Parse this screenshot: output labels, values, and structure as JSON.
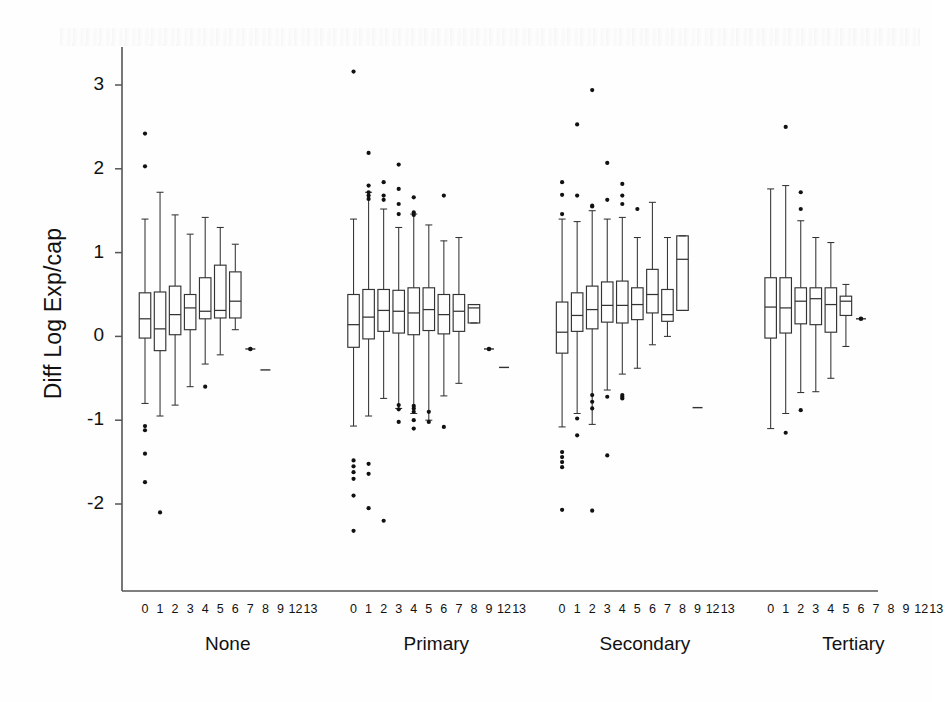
{
  "figure": {
    "background": "#fefefe",
    "ink": "#1a1a1a",
    "axis_color": "#555555",
    "box_color": "#333333",
    "outlier_color": "#111111"
  },
  "axes": {
    "y_label": "Diff Log Exp/cap",
    "y_ticks": [
      "3",
      "2",
      "1",
      "0",
      "-1",
      "-2"
    ],
    "y_tick_values": [
      3,
      2,
      1,
      0,
      -1,
      -2
    ],
    "x_label": "",
    "group_labels": [
      "None",
      "Primary",
      "Secondary",
      "Tertiary"
    ],
    "category_labels": [
      "0",
      "1",
      "2",
      "3",
      "4",
      "5",
      "6",
      "7",
      "8",
      "9",
      "12",
      "13"
    ],
    "frame": {
      "left": 122,
      "right": 878,
      "top": 47,
      "bottom": 591
    },
    "ylim": [
      -2.45,
      3.35
    ],
    "grid": false,
    "legend": "none"
  },
  "chart_data": {
    "type": "box",
    "title": "",
    "xlabel": "",
    "ylabel": "Diff Log Exp/cap",
    "ylim": [
      -2.45,
      3.35
    ],
    "grid": false,
    "legend_position": "none",
    "categories": [
      "0",
      "1",
      "2",
      "3",
      "4",
      "5",
      "6",
      "7",
      "8",
      "9",
      "12",
      "13"
    ],
    "groups": [
      {
        "name": "None",
        "boxes": [
          {
            "cat": "0",
            "whisker_low": -0.8,
            "q1": -0.02,
            "median": 0.21,
            "q3": 0.52,
            "whisker_high": 1.4,
            "outliers": [
              2.42,
              2.03,
              -1.07,
              -1.12,
              -1.4,
              -1.74
            ]
          },
          {
            "cat": "1",
            "whisker_low": -0.95,
            "q1": -0.17,
            "median": 0.09,
            "q3": 0.53,
            "whisker_high": 1.72,
            "outliers": [
              -2.1
            ]
          },
          {
            "cat": "2",
            "whisker_low": -0.82,
            "q1": 0.02,
            "median": 0.26,
            "q3": 0.6,
            "whisker_high": 1.45,
            "outliers": []
          },
          {
            "cat": "3",
            "whisker_low": -0.6,
            "q1": 0.08,
            "median": 0.34,
            "q3": 0.5,
            "whisker_high": 1.22,
            "outliers": []
          },
          {
            "cat": "4",
            "whisker_low": -0.33,
            "q1": 0.21,
            "median": 0.3,
            "q3": 0.7,
            "whisker_high": 1.42,
            "outliers": [
              -0.6
            ]
          },
          {
            "cat": "5",
            "whisker_low": -0.22,
            "q1": 0.22,
            "median": 0.31,
            "q3": 0.85,
            "whisker_high": 1.3,
            "outliers": []
          },
          {
            "cat": "6",
            "whisker_low": 0.08,
            "q1": 0.22,
            "median": 0.42,
            "q3": 0.77,
            "whisker_high": 1.1,
            "outliers": []
          },
          {
            "cat": "7",
            "whisker_low": -0.15,
            "q1": -0.15,
            "median": -0.15,
            "q3": -0.15,
            "whisker_high": -0.15,
            "outliers": []
          },
          {
            "cat": "8",
            "whisker_low": -0.4,
            "q1": -0.4,
            "median": -0.4,
            "q3": -0.4,
            "whisker_high": -0.4,
            "outliers": []
          }
        ]
      },
      {
        "name": "Primary",
        "boxes": [
          {
            "cat": "0",
            "whisker_low": -1.07,
            "q1": -0.13,
            "median": 0.14,
            "q3": 0.5,
            "whisker_high": 1.4,
            "outliers": [
              3.16,
              -1.48,
              -1.55,
              -1.62,
              -1.7,
              -1.9,
              -2.32
            ]
          },
          {
            "cat": "1",
            "whisker_low": -0.95,
            "q1": -0.03,
            "median": 0.23,
            "q3": 0.56,
            "whisker_high": 1.72,
            "outliers": [
              2.19,
              1.8,
              1.72,
              1.68,
              1.64,
              -1.52,
              -1.64,
              -2.05
            ]
          },
          {
            "cat": "2",
            "whisker_low": -0.74,
            "q1": 0.06,
            "median": 0.31,
            "q3": 0.56,
            "whisker_high": 1.52,
            "outliers": [
              1.84,
              1.68,
              1.63,
              -2.2
            ]
          },
          {
            "cat": "3",
            "whisker_low": -0.86,
            "q1": 0.04,
            "median": 0.3,
            "q3": 0.55,
            "whisker_high": 1.3,
            "outliers": [
              2.05,
              1.76,
              1.58,
              1.46,
              -0.82,
              -0.87,
              -1.02
            ]
          },
          {
            "cat": "4",
            "whisker_low": -0.92,
            "q1": 0.02,
            "median": 0.28,
            "q3": 0.58,
            "whisker_high": 1.46,
            "outliers": [
              1.66,
              1.48,
              1.45,
              -0.83,
              -0.86,
              -0.9,
              -1.0,
              -1.1
            ]
          },
          {
            "cat": "5",
            "whisker_low": -1.0,
            "q1": 0.07,
            "median": 0.32,
            "q3": 0.58,
            "whisker_high": 1.33,
            "outliers": [
              -0.9,
              -1.02
            ]
          },
          {
            "cat": "6",
            "whisker_low": -0.71,
            "q1": 0.03,
            "median": 0.26,
            "q3": 0.5,
            "whisker_high": 1.14,
            "outliers": [
              1.68,
              -1.08
            ]
          },
          {
            "cat": "7",
            "whisker_low": -0.56,
            "q1": 0.06,
            "median": 0.3,
            "q3": 0.5,
            "whisker_high": 1.18,
            "outliers": []
          },
          {
            "cat": "8",
            "whisker_low": 0.16,
            "q1": 0.16,
            "median": 0.34,
            "q3": 0.38,
            "whisker_high": 0.38,
            "outliers": []
          },
          {
            "cat": "9",
            "whisker_low": -0.15,
            "q1": -0.15,
            "median": -0.15,
            "q3": -0.15,
            "whisker_high": -0.15,
            "outliers": []
          },
          {
            "cat": "12",
            "whisker_low": -0.37,
            "q1": -0.37,
            "median": -0.37,
            "q3": -0.37,
            "whisker_high": -0.37,
            "outliers": []
          }
        ]
      },
      {
        "name": "Secondary",
        "boxes": [
          {
            "cat": "0",
            "whisker_low": -1.08,
            "q1": -0.2,
            "median": 0.05,
            "q3": 0.41,
            "whisker_high": 1.4,
            "outliers": [
              1.84,
              1.69,
              1.46,
              -1.38,
              -1.44,
              -1.5,
              -1.56,
              -2.07
            ]
          },
          {
            "cat": "1",
            "whisker_low": -0.92,
            "q1": 0.06,
            "median": 0.25,
            "q3": 0.52,
            "whisker_high": 1.37,
            "outliers": [
              2.53,
              1.68,
              -0.98,
              -1.18
            ]
          },
          {
            "cat": "2",
            "whisker_low": -1.05,
            "q1": 0.09,
            "median": 0.32,
            "q3": 0.6,
            "whisker_high": 1.5,
            "outliers": [
              2.94,
              1.56,
              1.55,
              -0.7,
              -0.78,
              -0.86,
              -2.08
            ]
          },
          {
            "cat": "3",
            "whisker_low": -0.64,
            "q1": 0.17,
            "median": 0.37,
            "q3": 0.65,
            "whisker_high": 1.4,
            "outliers": [
              2.07,
              1.63,
              -0.72,
              -1.42
            ]
          },
          {
            "cat": "4",
            "whisker_low": -0.45,
            "q1": 0.16,
            "median": 0.37,
            "q3": 0.66,
            "whisker_high": 1.42,
            "outliers": [
              1.82,
              1.68,
              1.58,
              -0.74,
              -0.72,
              -0.7
            ]
          },
          {
            "cat": "5",
            "whisker_low": -0.38,
            "q1": 0.2,
            "median": 0.38,
            "q3": 0.58,
            "whisker_high": 1.18,
            "outliers": [
              1.52
            ]
          },
          {
            "cat": "6",
            "whisker_low": -0.1,
            "q1": 0.28,
            "median": 0.5,
            "q3": 0.8,
            "whisker_high": 1.6,
            "outliers": []
          },
          {
            "cat": "7",
            "whisker_low": 0.0,
            "q1": 0.18,
            "median": 0.26,
            "q3": 0.56,
            "whisker_high": 1.18,
            "outliers": []
          },
          {
            "cat": "8",
            "whisker_low": 0.31,
            "q1": 0.31,
            "median": 0.92,
            "q3": 1.2,
            "whisker_high": 1.2,
            "outliers": []
          },
          {
            "cat": "9",
            "whisker_low": -0.85,
            "q1": -0.85,
            "median": -0.85,
            "q3": -0.85,
            "whisker_high": -0.85,
            "outliers": []
          }
        ]
      },
      {
        "name": "Tertiary",
        "boxes": [
          {
            "cat": "0",
            "whisker_low": -1.1,
            "q1": -0.02,
            "median": 0.35,
            "q3": 0.7,
            "whisker_high": 1.76,
            "outliers": []
          },
          {
            "cat": "1",
            "whisker_low": -0.92,
            "q1": 0.04,
            "median": 0.34,
            "q3": 0.7,
            "whisker_high": 1.8,
            "outliers": [
              2.5,
              -1.15
            ]
          },
          {
            "cat": "2",
            "whisker_low": -0.67,
            "q1": 0.15,
            "median": 0.42,
            "q3": 0.58,
            "whisker_high": 1.38,
            "outliers": [
              1.72,
              1.52,
              -0.88
            ]
          },
          {
            "cat": "3",
            "whisker_low": -0.66,
            "q1": 0.14,
            "median": 0.45,
            "q3": 0.58,
            "whisker_high": 1.18,
            "outliers": []
          },
          {
            "cat": "4",
            "whisker_low": -0.5,
            "q1": 0.05,
            "median": 0.38,
            "q3": 0.58,
            "whisker_high": 1.12,
            "outliers": []
          },
          {
            "cat": "5",
            "whisker_low": -0.12,
            "q1": 0.25,
            "median": 0.42,
            "q3": 0.48,
            "whisker_high": 0.62,
            "outliers": []
          },
          {
            "cat": "6",
            "whisker_low": 0.21,
            "q1": 0.21,
            "median": 0.21,
            "q3": 0.21,
            "whisker_high": 0.21,
            "outliers": []
          }
        ]
      }
    ]
  }
}
